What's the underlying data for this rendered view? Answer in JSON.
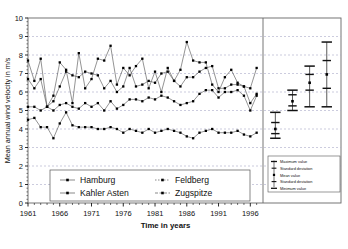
{
  "chart_data": {
    "type": "line",
    "title": "",
    "xlabel": "Time in years",
    "ylabel": "Mean annual wind velocity in m/s",
    "ylim": [
      0,
      10
    ],
    "ytick_labels": [
      "0",
      "1",
      "2",
      "3",
      "4",
      "5",
      "6",
      "7",
      "8",
      "9",
      "10"
    ],
    "xlim": [
      1961,
      1998
    ],
    "xtick_labels": [
      "1961",
      "1966",
      "1971",
      "1976",
      "1981",
      "1986",
      "1991",
      "1996"
    ],
    "xtick_values": [
      1961,
      1966,
      1971,
      1976,
      1981,
      1986,
      1991,
      1996
    ],
    "grid": "horizontal-dashed",
    "legend_position": "bottom-center",
    "x": [
      1961,
      1962,
      1963,
      1964,
      1965,
      1966,
      1967,
      1968,
      1969,
      1970,
      1971,
      1972,
      1973,
      1974,
      1975,
      1976,
      1977,
      1978,
      1979,
      1980,
      1981,
      1982,
      1983,
      1984,
      1985,
      1986,
      1987,
      1988,
      1989,
      1990,
      1991,
      1992,
      1993,
      1994,
      1995,
      1996,
      1997
    ],
    "series": [
      {
        "name": "Hamburg",
        "marker": "square",
        "values": [
          4.5,
          4.6,
          4.1,
          4.1,
          3.5,
          4.3,
          4.9,
          4.2,
          4.1,
          4.1,
          4.1,
          4.0,
          4.0,
          4.1,
          4.0,
          3.8,
          4.0,
          3.9,
          3.8,
          4.0,
          3.8,
          3.9,
          4.0,
          3.9,
          3.8,
          3.6,
          3.5,
          3.8,
          3.9,
          4.0,
          3.8,
          3.8,
          3.8,
          3.9,
          3.7,
          3.6,
          3.8
        ]
      },
      {
        "name": "Feldberg",
        "marker": "square",
        "values": [
          5.2,
          5.2,
          5.0,
          5.2,
          5.0,
          5.3,
          5.4,
          5.2,
          5.1,
          5.4,
          5.2,
          5.4,
          5.0,
          5.5,
          5.1,
          5.3,
          5.6,
          5.6,
          5.5,
          5.7,
          5.6,
          5.8,
          5.7,
          5.5,
          5.3,
          5.4,
          5.5,
          5.9,
          6.1,
          6.1,
          5.7,
          6.0,
          6.0,
          6.1,
          5.8,
          5.0,
          5.8
        ]
      },
      {
        "name": "Kahler Asten",
        "marker": "square",
        "values": [
          6.7,
          6.2,
          6.7,
          5.2,
          5.5,
          6.3,
          7.1,
          6.9,
          6.8,
          7.1,
          7.0,
          6.9,
          6.2,
          6.6,
          6.0,
          6.3,
          7.3,
          6.3,
          6.4,
          6.6,
          6.5,
          7.0,
          7.1,
          6.6,
          6.3,
          6.8,
          6.8,
          7.1,
          7.3,
          7.4,
          6.2,
          6.2,
          6.4,
          6.4,
          6.3,
          5.4,
          5.9
        ]
      },
      {
        "name": "Zugspitze",
        "marker": "square",
        "values": [
          7.7,
          6.6,
          7.8,
          5.2,
          5.8,
          7.6,
          7.2,
          5.4,
          8.1,
          6.2,
          6.7,
          7.8,
          7.7,
          8.5,
          6.4,
          7.3,
          6.9,
          7.4,
          7.8,
          6.2,
          7.1,
          6.0,
          7.3,
          6.6,
          7.2,
          8.7,
          7.7,
          7.6,
          7.6,
          6.4,
          6.0,
          6.8,
          7.2,
          6.5,
          6.3,
          6.2,
          7.3
        ]
      }
    ],
    "summary_panel": {
      "description": "Summary statistics bars for each station",
      "stats": [
        {
          "name": "Hamburg",
          "maximum": 4.9,
          "plus_sd": 4.35,
          "mean": 4.0,
          "minus_sd": 3.75,
          "minimum": 3.5
        },
        {
          "name": "Feldberg",
          "maximum": 6.1,
          "plus_sd": 5.85,
          "mean": 5.5,
          "minus_sd": 5.25,
          "minimum": 5.0
        },
        {
          "name": "Kahler Asten",
          "maximum": 7.4,
          "plus_sd": 6.95,
          "mean": 6.5,
          "minus_sd": 6.1,
          "minimum": 5.2
        },
        {
          "name": "Zugspitze",
          "maximum": 8.7,
          "plus_sd": 7.7,
          "mean": 6.95,
          "minus_sd": 6.2,
          "minimum": 5.2
        }
      ],
      "legend_items": [
        "Maximum value",
        "Standard deviation",
        "Mean value",
        "Standard deviation",
        "Minimum value"
      ]
    },
    "colors": {
      "line": "#3a3a3a",
      "marker": "#000000",
      "grid": "#a9a9c8",
      "frame": "#666666",
      "background": "#ffffff"
    }
  }
}
